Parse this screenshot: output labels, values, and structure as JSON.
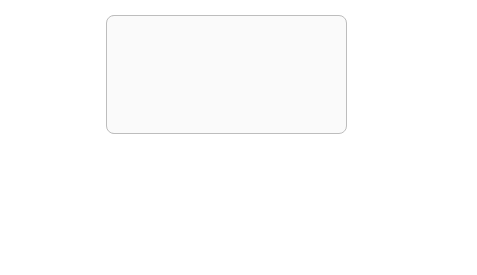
{
  "groups": {
    "counter_example_generation": {
      "title": "Counter-example generation"
    },
    "repair": {
      "title": "Repair"
    }
  },
  "inputs": {
    "specification": {
      "label": "Specification Φ",
      "icon": "document-icon",
      "icon_text": "φ(x)"
    },
    "dnn": {
      "label": "DNN N",
      "icon": "neural-network-icon"
    },
    "dataset": {
      "label": "Data set (X, Y)",
      "sublabel": "(Optional)",
      "icon": "stacked-documents-icon"
    }
  },
  "nodes": {
    "counter_example_search": {
      "label_line1": "Counter-example",
      "label_line2": "search"
    },
    "counter_example_found": {
      "label_line1": "Counter-example",
      "label_line2": "found?"
    },
    "verifier": {
      "label": "Verifier"
    },
    "specification_satisfied": {
      "label_line1": "Specification",
      "label_line2": "satisfied?"
    },
    "retrain_network": {
      "label": "Retrain network"
    },
    "penalty_weights": {
      "label": "Penalty weights",
      "cells": [
        "μ₁",
        "μ₂",
        "…",
        "μₙ"
      ]
    },
    "counter_examples": {
      "label": "Counter-examples x",
      "subscript": "i",
      "superscript": "c",
      "icon": "warning-triangle-icon"
    }
  },
  "output": {
    "label_line1": "Output repaired",
    "label_line2": "DNN N",
    "icon": "neural-network-icon"
  },
  "edge_labels": {
    "found_no": "no",
    "found_yes": "yes",
    "satisfied_yes": "yes",
    "satisfied_no": "no"
  }
}
